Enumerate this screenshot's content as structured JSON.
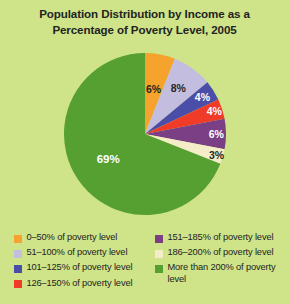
{
  "background_color": "#cfe389",
  "title": {
    "line1": "Population Distribution by Income as a",
    "line2": "Percentage of Poverty Level, 2005"
  },
  "chart_data": {
    "type": "pie",
    "title": "Population Distribution by Income as a Percentage of Poverty Level, 2005",
    "xlabel": "",
    "ylabel": "",
    "legend_position": "bottom",
    "grid": false,
    "start_angle_deg": 0,
    "direction": "clockwise",
    "categories": [
      "0–50% of poverty level",
      "51–100% of poverty level",
      "101–125% of poverty level",
      "126–150% of poverty level",
      "151–185% of poverty level",
      "186–200% of poverty level",
      "More than 200% of poverty level"
    ],
    "values": [
      6,
      8,
      4,
      4,
      6,
      3,
      69
    ],
    "data_labels": [
      "6%",
      "8%",
      "4%",
      "4%",
      "6%",
      "3%",
      "69%"
    ],
    "colors": [
      "#f5a32c",
      "#c3bee0",
      "#4b4ea8",
      "#ef3b28",
      "#7b3f86",
      "#f4edc8",
      "#56a032"
    ],
    "label_text_colors": [
      "#24261f",
      "#24261f",
      "#ffffff",
      "#ffffff",
      "#ffffff",
      "#24261f",
      "#ffffff"
    ],
    "units": "percent"
  },
  "legend": {
    "left_column": [
      {
        "label": "0–50% of poverty level",
        "color": "#f5a32c",
        "swatch_name": "legend-swatch-0-50"
      },
      {
        "label": "51–100% of poverty level",
        "color": "#c3bee0",
        "swatch_name": "legend-swatch-51-100"
      },
      {
        "label": "101–125% of poverty level",
        "color": "#4b4ea8",
        "swatch_name": "legend-swatch-101-125"
      },
      {
        "label": "126–150% of poverty level",
        "color": "#ef3b28",
        "swatch_name": "legend-swatch-126-150"
      }
    ],
    "right_column": [
      {
        "label": "151–185% of poverty level",
        "color": "#7b3f86",
        "swatch_name": "legend-swatch-151-185"
      },
      {
        "label": "186–200% of poverty level",
        "color": "#f4edc8",
        "swatch_name": "legend-swatch-186-200"
      },
      {
        "label": "More than 200% of\npoverty level",
        "color": "#56a032",
        "swatch_name": "legend-swatch-more-than-200"
      }
    ]
  }
}
